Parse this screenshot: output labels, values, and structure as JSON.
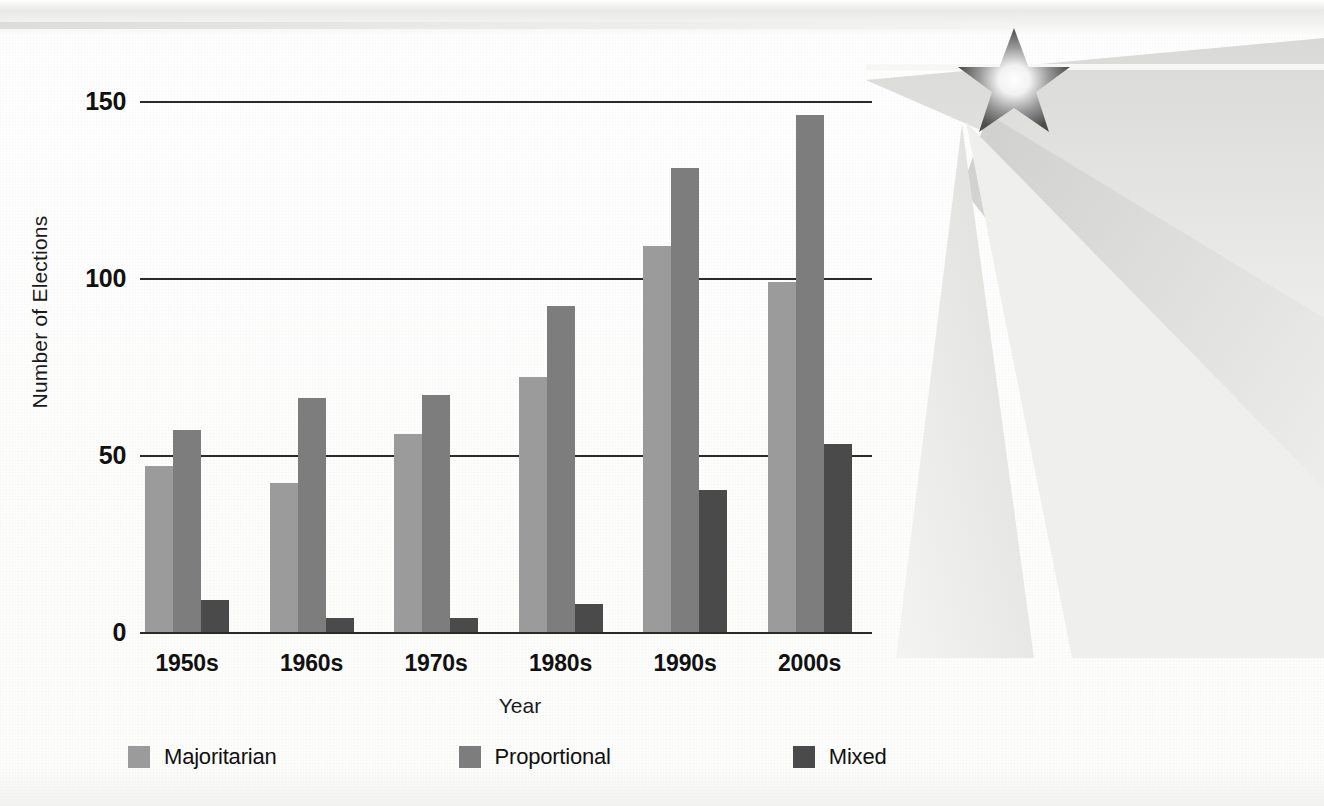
{
  "figure": {
    "background_color": "#fdfdfc",
    "decoration": {
      "star_icon_name": "star-burst-icon",
      "description": "five-pointed star with light rays"
    }
  },
  "chart_data": {
    "type": "bar",
    "title": "",
    "xlabel": "Year",
    "ylabel": "Number of Elections",
    "categories": [
      "1950s",
      "1960s",
      "1970s",
      "1980s",
      "1990s",
      "2000s"
    ],
    "series": [
      {
        "name": "Majoritarian",
        "color": "#9b9b9b",
        "values": [
          47,
          42,
          56,
          72,
          109,
          99
        ]
      },
      {
        "name": "Proportional",
        "color": "#7d7d7d",
        "values": [
          57,
          66,
          67,
          92,
          131,
          146
        ]
      },
      {
        "name": "Mixed",
        "color": "#4a4a4a",
        "values": [
          9,
          4,
          4,
          8,
          40,
          53
        ]
      }
    ],
    "yticks": [
      "0",
      "50",
      "100",
      "150"
    ],
    "ytick_values": [
      0,
      50,
      100,
      150
    ],
    "ylim": [
      0,
      155
    ],
    "grid": "horizontal",
    "legend_position": "bottom-left",
    "axis_color": "#2b2b2b"
  }
}
